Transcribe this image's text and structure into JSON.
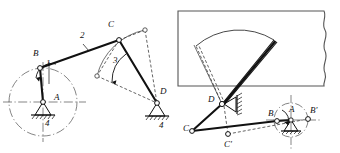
{
  "figure": {
    "title": "",
    "type": "mechanism-kinematic-diagram",
    "background_color": "#ffffff",
    "line_color": "#1a1a1a",
    "dash_color": "#2b2b2b"
  },
  "left_diagram": {
    "name": "four-bar-crank-rocker-schematic",
    "link_labels": [
      {
        "id": "link-1",
        "text": "1",
        "x": 46,
        "y": 66,
        "desc": "crank AB"
      },
      {
        "id": "link-2",
        "text": "2",
        "x": 80,
        "y": 38,
        "desc": "coupler BC"
      },
      {
        "id": "link-3",
        "text": "3",
        "x": 113,
        "y": 63,
        "desc": "rocker CD"
      },
      {
        "id": "link-4-left",
        "text": "4",
        "x": 45,
        "y": 121,
        "desc": "frame at A"
      },
      {
        "id": "link-4-right",
        "text": "4",
        "x": 159,
        "y": 124,
        "desc": "frame at D"
      }
    ],
    "joint_labels": [
      {
        "id": "joint-B",
        "text": "B",
        "x": 33,
        "y": 56
      },
      {
        "id": "joint-A",
        "text": "A",
        "x": 54,
        "y": 100
      },
      {
        "id": "joint-C",
        "text": "C",
        "x": 108,
        "y": 27
      },
      {
        "id": "joint-D",
        "text": "D",
        "x": 160,
        "y": 94
      }
    ],
    "joints": [
      {
        "id": "A",
        "x": 43,
        "y": 102
      },
      {
        "id": "B",
        "x": 40,
        "y": 68
      },
      {
        "id": "C",
        "x": 119,
        "y": 40
      },
      {
        "id": "D",
        "x": 157,
        "y": 103
      },
      {
        "id": "C-alt-left",
        "x": 97,
        "y": 76
      },
      {
        "id": "C-alt-right",
        "x": 145,
        "y": 30
      }
    ],
    "crank_circle": {
      "cx": 43,
      "cy": 102,
      "r": 34
    },
    "rotation_arrow": "counterclockwise"
  },
  "right_diagram": {
    "name": "windshield-wiper-application",
    "window_panel": {
      "x": 178,
      "y": 11,
      "width": 152,
      "height": 75,
      "break_edge": "wavy-right"
    },
    "wiper_sweep": {
      "desc": "swept arc sector of wiper blade"
    },
    "joint_labels": [
      {
        "id": "joint-D",
        "text": "D",
        "x": 211,
        "y": 100
      },
      {
        "id": "joint-C",
        "text": "C",
        "x": 186,
        "y": 128
      },
      {
        "id": "joint-C-prime",
        "text": "C'",
        "x": 227,
        "y": 143
      },
      {
        "id": "joint-B",
        "text": "B",
        "x": 270,
        "y": 113
      },
      {
        "id": "joint-A",
        "text": "A",
        "x": 292,
        "y": 108
      },
      {
        "id": "joint-B-prime",
        "text": "B'",
        "x": 313,
        "y": 110
      }
    ],
    "joints": [
      {
        "id": "D",
        "x": 222,
        "y": 104
      },
      {
        "id": "C",
        "x": 192,
        "y": 131
      },
      {
        "id": "C-prime",
        "x": 228,
        "y": 134
      },
      {
        "id": "B",
        "x": 277,
        "y": 121
      },
      {
        "id": "A",
        "x": 291,
        "y": 120
      },
      {
        "id": "B-prime",
        "x": 308,
        "y": 119
      }
    ],
    "crank_circle": {
      "cx": 291,
      "cy": 120,
      "r": 17
    },
    "rotation_arrow": "clockwise"
  }
}
